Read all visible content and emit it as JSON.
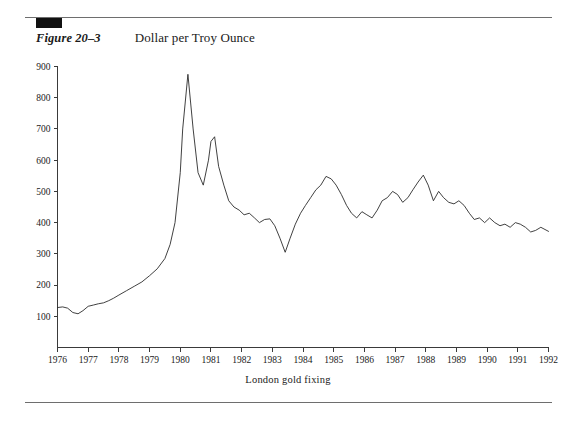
{
  "figure": {
    "label": "Figure 20–3",
    "title": "Dollar per Troy Ounce",
    "caption": "London gold fixing",
    "marker_color": "#111111",
    "rule_color": "#6e6e6e",
    "line_color": "#2b2b2b"
  },
  "chart_data": {
    "type": "line",
    "title": "Dollar per Troy Ounce",
    "xlabel": "London gold fixing",
    "ylabel": "",
    "xlim": [
      1976,
      1992
    ],
    "ylim": [
      0,
      900
    ],
    "grid": false,
    "legend": null,
    "ytick_labels": [
      "100",
      "200",
      "300",
      "400",
      "500",
      "600",
      "700",
      "800",
      "900"
    ],
    "yticks": [
      100,
      200,
      300,
      400,
      500,
      600,
      700,
      800,
      900
    ],
    "xtick_labels": [
      "1976",
      "1977",
      "1978",
      "1979",
      "1980",
      "1981",
      "1982",
      "1983",
      "1984",
      "1985",
      "1986",
      "1987",
      "1988",
      "1989",
      "1990",
      "1991",
      "1992"
    ],
    "xticks": [
      1976,
      1977,
      1978,
      1979,
      1980,
      1981,
      1982,
      1983,
      1984,
      1985,
      1986,
      1987,
      1988,
      1989,
      1990,
      1991,
      1992
    ],
    "series": [
      {
        "name": "London gold fixing",
        "x": [
          1976.0,
          1976.17,
          1976.33,
          1976.5,
          1976.67,
          1976.83,
          1977.0,
          1977.17,
          1977.33,
          1977.5,
          1977.67,
          1977.83,
          1978.0,
          1978.25,
          1978.5,
          1978.75,
          1979.0,
          1979.25,
          1979.5,
          1979.67,
          1979.83,
          1980.0,
          1980.08,
          1980.25,
          1980.42,
          1980.58,
          1980.75,
          1980.92,
          1981.0,
          1981.12,
          1981.25,
          1981.42,
          1981.58,
          1981.75,
          1981.92,
          1982.08,
          1982.25,
          1982.42,
          1982.58,
          1982.75,
          1982.92,
          1983.08,
          1983.25,
          1983.42,
          1983.58,
          1983.75,
          1983.92,
          1984.08,
          1984.25,
          1984.42,
          1984.58,
          1984.75,
          1984.92,
          1985.08,
          1985.25,
          1985.42,
          1985.58,
          1985.75,
          1985.92,
          1986.08,
          1986.25,
          1986.42,
          1986.58,
          1986.75,
          1986.92,
          1987.08,
          1987.25,
          1987.42,
          1987.58,
          1987.75,
          1987.92,
          1988.08,
          1988.25,
          1988.42,
          1988.58,
          1988.75,
          1988.92,
          1989.08,
          1989.25,
          1989.42,
          1989.58,
          1989.75,
          1989.92,
          1990.08,
          1990.25,
          1990.42,
          1990.58,
          1990.75,
          1990.92,
          1991.08,
          1991.25,
          1991.42,
          1991.58,
          1991.75,
          1992.0
        ],
        "y": [
          128,
          130,
          126,
          112,
          108,
          118,
          132,
          136,
          140,
          143,
          150,
          158,
          168,
          182,
          196,
          210,
          230,
          252,
          285,
          330,
          400,
          560,
          700,
          875,
          700,
          560,
          520,
          600,
          660,
          675,
          580,
          520,
          470,
          450,
          440,
          425,
          430,
          415,
          400,
          410,
          412,
          390,
          350,
          305,
          350,
          395,
          430,
          455,
          480,
          505,
          520,
          548,
          540,
          520,
          490,
          455,
          430,
          415,
          435,
          425,
          415,
          440,
          470,
          480,
          500,
          490,
          465,
          480,
          505,
          530,
          552,
          520,
          470,
          500,
          480,
          465,
          460,
          470,
          455,
          430,
          410,
          415,
          400,
          415,
          400,
          390,
          395,
          385,
          400,
          395,
          385,
          370,
          375,
          385,
          372
        ]
      }
    ],
    "annotations": {
      "peak_1980": {
        "x": 1980.25,
        "y": 875
      },
      "peak_1981": {
        "x": 1981.12,
        "y": 675
      },
      "trough_1982": {
        "x": 1983.42,
        "y": 305
      },
      "peak_1987": {
        "x": 1987.92,
        "y": 552
      }
    }
  },
  "icons": {
    "black-block-marker": "solid-rectangle"
  }
}
